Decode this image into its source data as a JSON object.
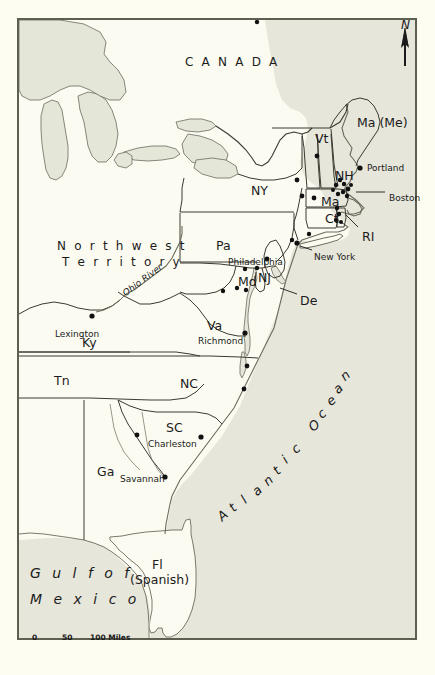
{
  "map": {
    "title_regions": [
      {
        "name": "canada",
        "label": "C A N A D A",
        "x": 185,
        "y": 56
      },
      {
        "name": "northwest-territory-line1",
        "label": "N o r t h w e s t",
        "x": 57,
        "y": 240
      },
      {
        "name": "northwest-territory-line2",
        "label": "T e r r i t o r y",
        "x": 62,
        "y": 256
      }
    ],
    "states": [
      {
        "name": "ma-me",
        "label": "Ma (Me)",
        "x": 357,
        "y": 117
      },
      {
        "name": "vt",
        "label": "Vt",
        "x": 315,
        "y": 133
      },
      {
        "name": "nh",
        "label": "NH",
        "x": 335,
        "y": 170
      },
      {
        "name": "ny",
        "label": "NY",
        "x": 251,
        "y": 185
      },
      {
        "name": "ma",
        "label": "Ma",
        "x": 321,
        "y": 196
      },
      {
        "name": "ct",
        "label": "Ct",
        "x": 325,
        "y": 213
      },
      {
        "name": "ri",
        "label": "RI",
        "x": 362,
        "y": 231
      },
      {
        "name": "pa",
        "label": "Pa",
        "x": 216,
        "y": 240
      },
      {
        "name": "nj",
        "label": "NJ",
        "x": 258,
        "y": 272
      },
      {
        "name": "md",
        "label": "Md",
        "x": 238,
        "y": 276
      },
      {
        "name": "de",
        "label": "De",
        "x": 300,
        "y": 295
      },
      {
        "name": "va",
        "label": "Va",
        "x": 207,
        "y": 320
      },
      {
        "name": "ky",
        "label": "Ky",
        "x": 82,
        "y": 337
      },
      {
        "name": "tn",
        "label": "Tn",
        "x": 54,
        "y": 375
      },
      {
        "name": "nc",
        "label": "NC",
        "x": 180,
        "y": 378
      },
      {
        "name": "sc",
        "label": "SC",
        "x": 166,
        "y": 422
      },
      {
        "name": "ga",
        "label": "Ga",
        "x": 97,
        "y": 466
      },
      {
        "name": "fl",
        "label": "Fl",
        "x": 152,
        "y": 559
      },
      {
        "name": "fl-spanish",
        "label": "(Spanish)",
        "x": 130,
        "y": 574
      }
    ],
    "cities": [
      {
        "name": "portland",
        "label": "Portland",
        "x": 367,
        "y": 164,
        "dot_x": 360,
        "dot_y": 168
      },
      {
        "name": "boston",
        "label": "Boston",
        "x": 389,
        "y": 194,
        "dot_x": 348,
        "dot_y": 189
      },
      {
        "name": "new-york",
        "label": "New York",
        "x": 314,
        "y": 253,
        "dot_x": 297,
        "dot_y": 243
      },
      {
        "name": "philadelphia",
        "label": "Philadelphia",
        "x": 228,
        "y": 258,
        "dot_x": 267,
        "dot_y": 259
      },
      {
        "name": "lexington",
        "label": "Lexington",
        "x": 55,
        "y": 330,
        "dot_x": 92,
        "dot_y": 316
      },
      {
        "name": "richmond",
        "label": "Richmond",
        "x": 198,
        "y": 337,
        "dot_x": 245,
        "dot_y": 333
      },
      {
        "name": "charleston",
        "label": "Charleston",
        "x": 148,
        "y": 440,
        "dot_x": 201,
        "dot_y": 437
      },
      {
        "name": "savannah",
        "label": "Savannah",
        "x": 120,
        "y": 475,
        "dot_x": 165,
        "dot_y": 477
      }
    ],
    "water_labels": {
      "atlantic_ocean": "Atlantic Ocean",
      "gulf_line1": "G u l f   o f",
      "gulf_line2": "M e x i c o",
      "ohio_river": "Ohio River"
    },
    "compass": {
      "label": "N",
      "icon": "north-arrow-icon"
    },
    "scale_bar": {
      "ticks": [
        "0",
        "50",
        "100 Miles"
      ],
      "unit": "Miles"
    },
    "colors": {
      "paper": "#fdfdf2",
      "land": "#fbfbf2",
      "water": "#e6e6da",
      "lake": "#e4e6d8",
      "border": "#5d6051",
      "ink": "#1b1b1b",
      "coastline": "#6b6b5e"
    }
  }
}
